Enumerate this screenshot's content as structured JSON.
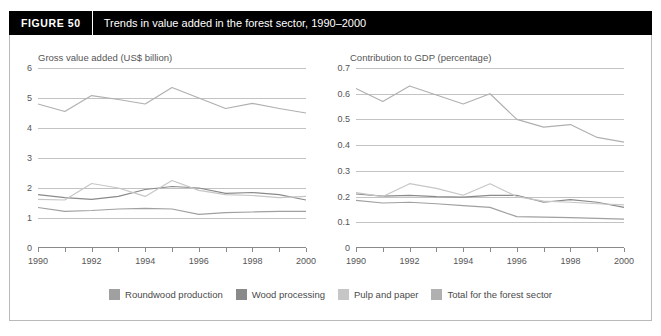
{
  "figure": {
    "tag": "FIGURE  50",
    "title": "Trends in value added in the forest sector, 1990–2000"
  },
  "legend": [
    {
      "label": "Roundwood production",
      "color": "#a0a0a0"
    },
    {
      "label": "Wood processing",
      "color": "#8a8a8a"
    },
    {
      "label": "Pulp and paper",
      "color": "#c6c6c6"
    },
    {
      "label": "Total for the forest sector",
      "color": "#b0b0b0"
    }
  ],
  "chart_data": [
    {
      "type": "line",
      "title": "Gross value added (US$ billion)",
      "xlabel": "",
      "ylabel": "",
      "x": [
        1990,
        1991,
        1992,
        1993,
        1994,
        1995,
        1996,
        1997,
        1998,
        1999,
        2000
      ],
      "xlim": [
        1990,
        2000
      ],
      "ylim": [
        0,
        6
      ],
      "yticks": [
        0,
        1,
        2,
        3,
        4,
        5,
        6
      ],
      "xticklabels": [
        "1990",
        "",
        "1992",
        "",
        "1994",
        "",
        "1996",
        "",
        "1998",
        "",
        "2000"
      ],
      "grid": true,
      "legend_position": "bottom",
      "series": [
        {
          "name": "Roundwood production",
          "color": "#a0a0a0",
          "values": [
            1.35,
            1.22,
            1.25,
            1.3,
            1.32,
            1.3,
            1.12,
            1.18,
            1.2,
            1.22,
            1.22
          ]
        },
        {
          "name": "Wood processing",
          "color": "#8a8a8a",
          "values": [
            1.78,
            1.68,
            1.62,
            1.72,
            1.95,
            2.05,
            2.0,
            1.82,
            1.85,
            1.78,
            1.6
          ]
        },
        {
          "name": "Pulp and paper",
          "color": "#c6c6c6",
          "values": [
            1.62,
            1.6,
            2.15,
            2.0,
            1.72,
            2.25,
            1.92,
            1.78,
            1.75,
            1.68,
            1.72
          ]
        },
        {
          "name": "Total for the forest sector",
          "color": "#b0b0b0",
          "values": [
            4.8,
            4.55,
            5.08,
            4.95,
            4.8,
            5.35,
            5.0,
            4.65,
            4.82,
            4.65,
            4.5
          ]
        }
      ]
    },
    {
      "type": "line",
      "title": "Contribution to GDP (percentage)",
      "xlabel": "",
      "ylabel": "",
      "x": [
        1990,
        1991,
        1992,
        1993,
        1994,
        1995,
        1996,
        1997,
        1998,
        1999,
        2000
      ],
      "xlim": [
        1990,
        2000
      ],
      "ylim": [
        0,
        0.7
      ],
      "yticks": [
        0,
        0.1,
        0.2,
        0.3,
        0.4,
        0.5,
        0.6,
        0.7
      ],
      "yticklabels": [
        "0",
        "0.1",
        "0.2",
        "0.3",
        "0.4",
        "0.5",
        "0.6",
        "0.7"
      ],
      "xticklabels": [
        "1990",
        "",
        "1992",
        "",
        "1994",
        "",
        "1996",
        "",
        "1998",
        "",
        "2000"
      ],
      "grid": true,
      "legend_position": "bottom",
      "series": [
        {
          "name": "Roundwood production",
          "color": "#a0a0a0",
          "values": [
            0.185,
            0.175,
            0.178,
            0.172,
            0.165,
            0.158,
            0.122,
            0.12,
            0.118,
            0.115,
            0.112
          ]
        },
        {
          "name": "Wood processing",
          "color": "#8a8a8a",
          "values": [
            0.21,
            0.202,
            0.205,
            0.2,
            0.198,
            0.205,
            0.205,
            0.178,
            0.188,
            0.178,
            0.158
          ]
        },
        {
          "name": "Pulp and paper",
          "color": "#c6c6c6",
          "values": [
            0.215,
            0.2,
            0.25,
            0.232,
            0.205,
            0.25,
            0.2,
            0.182,
            0.178,
            0.172,
            0.168
          ]
        },
        {
          "name": "Total for the forest sector",
          "color": "#b0b0b0",
          "values": [
            0.62,
            0.57,
            0.63,
            0.595,
            0.56,
            0.6,
            0.5,
            0.47,
            0.48,
            0.43,
            0.412
          ]
        }
      ]
    }
  ]
}
